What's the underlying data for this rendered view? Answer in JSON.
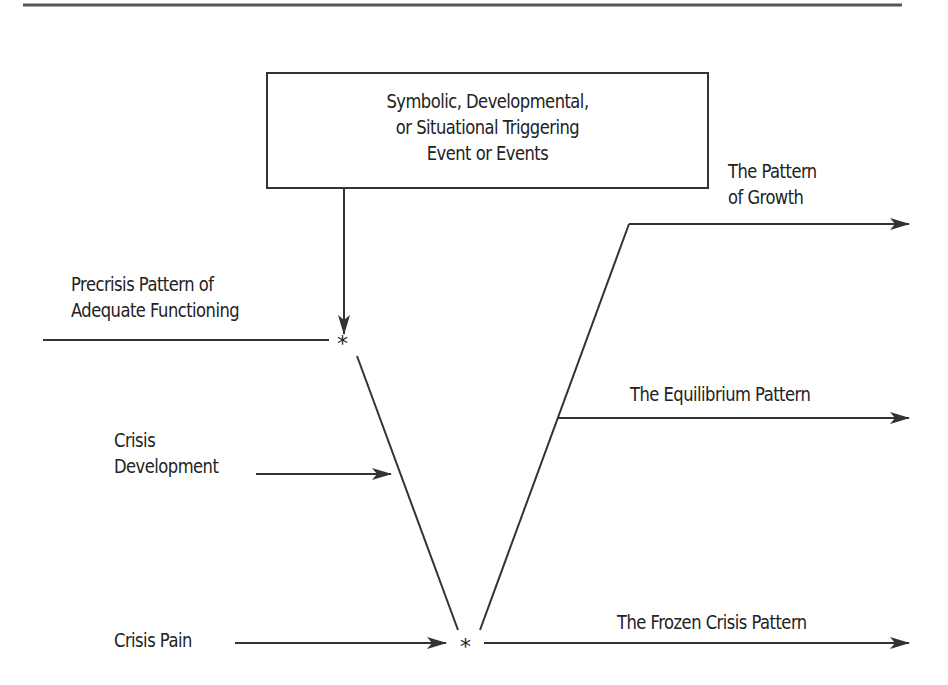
{
  "diagram": {
    "type": "crisis-pattern-flow",
    "trigger_box": {
      "lines": [
        "Symbolic, Developmental,",
        "or Situational Triggering",
        "Event or Events"
      ]
    },
    "labels": {
      "precrisis": [
        "Precrisis Pattern of",
        "Adequate Functioning"
      ],
      "crisis_development": [
        "Crisis",
        "Development"
      ],
      "crisis_pain": "Crisis Pain",
      "growth": [
        "The Pattern",
        "of Growth"
      ],
      "equilibrium": "The Equilibrium Pattern",
      "frozen": "The Frozen Crisis Pattern"
    },
    "markers": {
      "crisis_onset": "*",
      "crisis_bottom": "*"
    },
    "colors": {
      "line": "#333333",
      "text": "#222222",
      "background": "#ffffff"
    }
  }
}
